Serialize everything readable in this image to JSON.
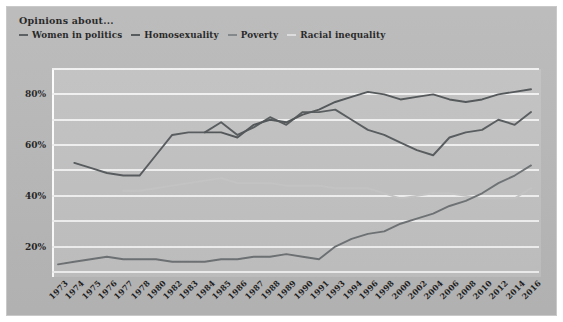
{
  "header": {
    "title": "Opinions about..."
  },
  "legend": {
    "position": "top-left",
    "items": [
      {
        "label": "Women in politics",
        "color": "#55595b",
        "marker": "line-dash"
      },
      {
        "label": "Homosexuality",
        "color": "#4f5355",
        "marker": "line-dash"
      },
      {
        "label": "Poverty",
        "color": "#7e8285",
        "marker": "line-dash"
      },
      {
        "label": "Racial inequality",
        "color": "#dcdcdc",
        "marker": "line-dash"
      }
    ]
  },
  "axes": {
    "y_ticks": [
      "20%",
      "40%",
      "60%",
      "80%"
    ],
    "y_tick_values": [
      20,
      40,
      60,
      80
    ],
    "ylim": [
      8,
      90
    ],
    "x_ticks": [
      "1973",
      "1974",
      "1975",
      "1976",
      "1977",
      "1978",
      "1980",
      "1982",
      "1983",
      "1984",
      "1985",
      "1986",
      "1987",
      "1988",
      "1989",
      "1990",
      "1991",
      "1993",
      "1994",
      "1996",
      "1998",
      "2000",
      "2002",
      "2004",
      "2006",
      "2008",
      "2010",
      "2012",
      "2014",
      "2016"
    ],
    "grid": "horizontal"
  },
  "chart_data": {
    "type": "line",
    "title": "Opinions about...",
    "xlabel": "",
    "ylabel": "",
    "ylim": [
      8,
      90
    ],
    "grid": true,
    "legend_position": "top-left",
    "x": [
      1973,
      1974,
      1975,
      1976,
      1977,
      1978,
      1980,
      1982,
      1983,
      1984,
      1985,
      1986,
      1987,
      1988,
      1989,
      1990,
      1991,
      1993,
      1994,
      1996,
      1998,
      2000,
      2002,
      2004,
      2006,
      2008,
      2010,
      2012,
      2014,
      2016
    ],
    "categories": [
      "1973",
      "1974",
      "1975",
      "1976",
      "1977",
      "1978",
      "1980",
      "1982",
      "1983",
      "1984",
      "1985",
      "1986",
      "1987",
      "1988",
      "1989",
      "1990",
      "1991",
      "1993",
      "1994",
      "1996",
      "1998",
      "2000",
      "2002",
      "2004",
      "2006",
      "2008",
      "2010",
      "2012",
      "2014",
      "2016"
    ],
    "series": [
      {
        "name": "Women in politics",
        "color": "#55595b",
        "values": [
          null,
          53,
          51,
          49,
          48,
          48,
          56,
          64,
          65,
          65,
          69,
          64,
          67,
          71,
          68,
          73,
          73,
          74,
          70,
          66,
          64,
          61,
          58,
          56,
          63,
          65,
          66,
          70,
          68,
          73
        ]
      },
      {
        "name": "Homosexuality",
        "color": "#4f5355",
        "values": [
          null,
          null,
          null,
          null,
          null,
          null,
          null,
          null,
          null,
          65,
          65,
          63,
          68,
          70,
          69,
          72,
          74,
          77,
          79,
          81,
          80,
          78,
          79,
          80,
          78,
          77,
          78,
          80,
          81,
          82
        ]
      },
      {
        "name": "Poverty",
        "color": "#c6c6c6",
        "values": [
          null,
          null,
          null,
          null,
          42,
          42,
          43,
          44,
          45,
          46,
          47,
          45,
          45,
          45,
          44,
          44,
          44,
          43,
          43,
          43,
          41,
          39,
          40,
          41,
          41,
          40,
          39,
          39,
          39,
          43
        ]
      },
      {
        "name": "Racial inequality",
        "color": "#6e7274",
        "values": [
          13,
          14,
          15,
          16,
          15,
          15,
          15,
          14,
          14,
          14,
          15,
          15,
          16,
          16,
          17,
          16,
          15,
          20,
          23,
          25,
          26,
          29,
          31,
          33,
          36,
          38,
          41,
          45,
          48,
          52
        ]
      }
    ]
  }
}
